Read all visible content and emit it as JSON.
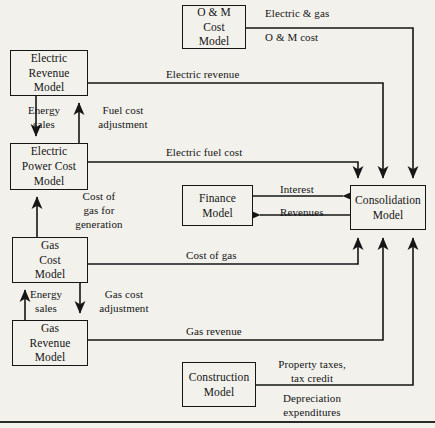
{
  "diagram": {
    "type": "flow-diagram",
    "background_color": "#f2f1ec",
    "line_color": "#161616",
    "nodes": [
      {
        "id": "electric-revenue-model",
        "lines": [
          "Electric",
          "Revenue",
          "Model"
        ],
        "x": 10,
        "y": 50,
        "w": 78,
        "h": 46
      },
      {
        "id": "electric-power-cost-model",
        "lines": [
          "Electric",
          "Power Cost",
          "Model"
        ],
        "x": 10,
        "y": 143,
        "w": 78,
        "h": 47
      },
      {
        "id": "gas-cost-model",
        "lines": [
          "Gas",
          "Cost",
          "Model"
        ],
        "x": 12,
        "y": 237,
        "w": 76,
        "h": 46
      },
      {
        "id": "gas-revenue-model",
        "lines": [
          "Gas",
          "Revenue",
          "Model"
        ],
        "x": 12,
        "y": 320,
        "w": 76,
        "h": 46
      },
      {
        "id": "om-cost-model",
        "lines": [
          "O & M",
          "Cost",
          "Model"
        ],
        "x": 182,
        "y": 5,
        "w": 64,
        "h": 44
      },
      {
        "id": "finance-model",
        "lines": [
          "Finance",
          "Model"
        ],
        "x": 182,
        "y": 185,
        "w": 71,
        "h": 41
      },
      {
        "id": "construction-model",
        "lines": [
          "Construction",
          "Model"
        ],
        "x": 182,
        "y": 362,
        "w": 74,
        "h": 45
      },
      {
        "id": "consolidation-model",
        "lines": [
          "Consolidation",
          "Model"
        ],
        "x": 350,
        "y": 185,
        "w": 76,
        "h": 45
      }
    ],
    "edge_labels": [
      {
        "id": "energy-sales-electric",
        "lines": [
          "Energy",
          "sales"
        ],
        "x": 44,
        "y": 104,
        "align": "center"
      },
      {
        "id": "fuel-cost-adjustment",
        "lines": [
          "Fuel cost",
          "adjustment"
        ],
        "x": 123,
        "y": 104,
        "align": "center"
      },
      {
        "id": "cost-of-gas-for-generation",
        "lines": [
          "Cost of",
          "gas for",
          "generation"
        ],
        "x": 99,
        "y": 190,
        "align": "center"
      },
      {
        "id": "energy-sales-gas",
        "lines": [
          "Energy",
          "sales"
        ],
        "x": 46,
        "y": 288,
        "align": "center"
      },
      {
        "id": "gas-cost-adjustment",
        "lines": [
          "Gas cost",
          "adjustment"
        ],
        "x": 124,
        "y": 288,
        "align": "center"
      },
      {
        "id": "electric-and-gas",
        "lines": [
          "Electric & gas"
        ],
        "x": 265,
        "y": 7,
        "align": "left"
      },
      {
        "id": "om-cost",
        "lines": [
          "O & M cost"
        ],
        "x": 265,
        "y": 31,
        "align": "left"
      },
      {
        "id": "electric-revenue",
        "lines": [
          "Electric revenue"
        ],
        "x": 166,
        "y": 68,
        "align": "left"
      },
      {
        "id": "electric-fuel-cost",
        "lines": [
          "Electric fuel cost"
        ],
        "x": 166,
        "y": 146,
        "align": "left"
      },
      {
        "id": "interest",
        "lines": [
          "Interest"
        ],
        "x": 280,
        "y": 183,
        "align": "left"
      },
      {
        "id": "revenues",
        "lines": [
          "Revenues"
        ],
        "x": 280,
        "y": 206,
        "align": "left"
      },
      {
        "id": "cost-of-gas",
        "lines": [
          "Cost of gas"
        ],
        "x": 186,
        "y": 249,
        "align": "left"
      },
      {
        "id": "gas-revenue",
        "lines": [
          "Gas revenue"
        ],
        "x": 186,
        "y": 325,
        "align": "left"
      },
      {
        "id": "property-taxes-tax-credit",
        "lines": [
          "Property taxes,",
          "tax credit"
        ],
        "x": 312,
        "y": 358,
        "align": "center"
      },
      {
        "id": "depreciation-expenditures",
        "lines": [
          "Depreciation",
          "expenditures"
        ],
        "x": 312,
        "y": 392,
        "align": "center"
      }
    ],
    "connections": [
      {
        "id": "electric-revenue-to-power-cost",
        "from": "electric-revenue-model",
        "to": "electric-power-cost-model",
        "label": "Energy sales",
        "direction": "down"
      },
      {
        "id": "power-cost-to-electric-revenue",
        "from": "electric-power-cost-model",
        "to": "electric-revenue-model",
        "label": "Fuel cost adjustment",
        "direction": "up"
      },
      {
        "id": "gas-cost-to-power-cost",
        "from": "gas-cost-model",
        "to": "electric-power-cost-model",
        "label": "Cost of gas for generation",
        "direction": "up"
      },
      {
        "id": "gas-revenue-to-gas-cost",
        "from": "gas-revenue-model",
        "to": "gas-cost-model",
        "label": "Energy sales",
        "direction": "up"
      },
      {
        "id": "gas-cost-to-gas-revenue",
        "from": "gas-cost-model",
        "to": "gas-revenue-model",
        "label": "Gas cost adjustment",
        "direction": "down"
      },
      {
        "id": "om-to-consolidation",
        "from": "om-cost-model",
        "to": "consolidation-model",
        "label": "Electric & gas O & M cost",
        "direction": "right-down"
      },
      {
        "id": "electric-revenue-to-consolidation",
        "from": "electric-revenue-model",
        "to": "consolidation-model",
        "label": "Electric revenue",
        "direction": "right-down"
      },
      {
        "id": "electric-fuel-cost-to-consolidation",
        "from": "electric-power-cost-model",
        "to": "consolidation-model",
        "label": "Electric fuel cost",
        "direction": "right-down"
      },
      {
        "id": "finance-to-consolidation",
        "from": "finance-model",
        "to": "consolidation-model",
        "label": "Interest",
        "direction": "right"
      },
      {
        "id": "consolidation-to-finance",
        "from": "consolidation-model",
        "to": "finance-model",
        "label": "Revenues",
        "direction": "left"
      },
      {
        "id": "gas-cost-to-consolidation",
        "from": "gas-cost-model",
        "to": "consolidation-model",
        "label": "Cost of gas",
        "direction": "right-up"
      },
      {
        "id": "gas-revenue-to-consolidation",
        "from": "gas-revenue-model",
        "to": "consolidation-model",
        "label": "Gas revenue",
        "direction": "right-up"
      },
      {
        "id": "construction-to-consolidation",
        "from": "construction-model",
        "to": "consolidation-model",
        "label": "Property taxes, tax credit / Depreciation expenditures",
        "direction": "right-up"
      }
    ]
  }
}
